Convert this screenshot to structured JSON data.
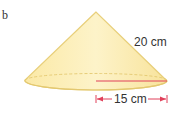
{
  "part_label": "b",
  "figure": {
    "shape": "cone",
    "slant_height_label": "20 cm",
    "radius_label": "15 cm",
    "colors": {
      "fill": "#fbeeb4",
      "edge": "#e8cf7a",
      "radius_line": "#e0405a",
      "arrow": "#e0405a",
      "text": "#333333"
    }
  }
}
